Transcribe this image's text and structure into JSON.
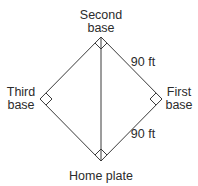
{
  "diagram": {
    "type": "baseball-diamond",
    "line_color": "#3a3a3a",
    "text_color": "#2b2b2b",
    "labels": {
      "second_base_line1": "Second",
      "second_base_line2": "base",
      "third_base_line1": "Third",
      "third_base_line2": "base",
      "first_base_line1": "First",
      "first_base_line2": "base",
      "home_plate": "Home plate",
      "side_top_right": "90 ft",
      "side_bottom_right": "90 ft"
    },
    "vertices": {
      "second_base": [
        101,
        37
      ],
      "first_base": [
        162,
        99
      ],
      "home_plate": [
        101,
        161
      ],
      "third_base": [
        40,
        99
      ]
    },
    "right_angle_markers": [
      "second_base",
      "first_base",
      "home_plate",
      "third_base"
    ],
    "diagonal": "home_plate-to-second_base"
  }
}
